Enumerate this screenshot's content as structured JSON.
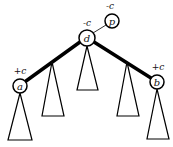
{
  "diagram": {
    "type": "tree",
    "nodes": [
      {
        "id": "d",
        "label": "d",
        "weight_label": "-c",
        "cx": 87,
        "cy": 38,
        "r": 8
      },
      {
        "id": "p",
        "label": "p",
        "weight_label": "-c",
        "cx": 112,
        "cy": 21,
        "r": 7
      },
      {
        "id": "a",
        "label": "a",
        "weight_label": "+c",
        "cx": 20,
        "cy": 86,
        "r": 7
      },
      {
        "id": "b",
        "label": "b",
        "weight_label": "+c",
        "cx": 157,
        "cy": 82,
        "r": 7
      }
    ],
    "edges": [
      {
        "from": "d",
        "to": "p",
        "style": "thin"
      },
      {
        "from": "d",
        "to": "a",
        "style": "thick"
      },
      {
        "from": "d",
        "to": "b",
        "style": "thick"
      }
    ],
    "subtrees": [
      {
        "id": "subtree-a",
        "apex": [
          20,
          93
        ],
        "base_left": [
          8,
          140
        ],
        "base_right": [
          32,
          140
        ]
      },
      {
        "id": "subtree-left-mid",
        "apex": [
          52,
          63
        ],
        "base_left": [
          42,
          116
        ],
        "base_right": [
          64,
          116
        ]
      },
      {
        "id": "subtree-center",
        "apex": [
          87,
          46
        ],
        "base_left": [
          77,
          90
        ],
        "base_right": [
          98,
          90
        ]
      },
      {
        "id": "subtree-right-mid",
        "apex": [
          127,
          63
        ],
        "base_left": [
          117,
          116
        ],
        "base_right": [
          139,
          116
        ]
      },
      {
        "id": "subtree-b",
        "apex": [
          157,
          89
        ],
        "base_left": [
          147,
          139
        ],
        "base_right": [
          169,
          139
        ]
      }
    ]
  }
}
